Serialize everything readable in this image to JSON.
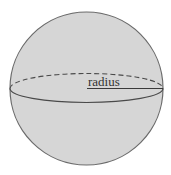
{
  "diagram": {
    "type": "sphere",
    "labels": {
      "radius": "radius"
    },
    "colors": {
      "background": "#ffffff",
      "sphere_fill": "#d6d6d6",
      "outline": "#6a6a6a",
      "equator_front": "#4a4a4a",
      "equator_back": "#4a4a4a",
      "radius_line": "#3a3a3a",
      "label": "#333333"
    }
  }
}
